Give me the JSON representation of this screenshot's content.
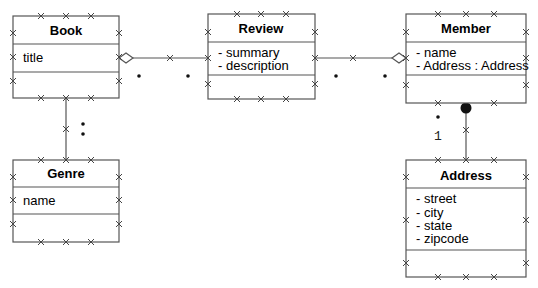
{
  "diagram": {
    "type": "UML class diagram",
    "line_color": "#555555",
    "classes": [
      {
        "name": "Book",
        "attributes": [
          "title"
        ]
      },
      {
        "name": "Review",
        "attributes": [
          "- summary",
          "- description"
        ]
      },
      {
        "name": "Member",
        "attributes": [
          "- name",
          "- Address : Address"
        ]
      },
      {
        "name": "Genre",
        "attributes": [
          "name"
        ]
      },
      {
        "name": "Address",
        "attributes": [
          "- street",
          "- city",
          "- state",
          "- zipcode"
        ]
      }
    ],
    "associations": [
      {
        "from": "Book",
        "to": "Review",
        "type": "aggregation",
        "end_marker_at": "Book",
        "multiplicity_marks": [
          "•",
          "•"
        ]
      },
      {
        "from": "Review",
        "to": "Member",
        "type": "aggregation",
        "end_marker_at": "Member",
        "multiplicity_marks": [
          "•",
          "•"
        ]
      },
      {
        "from": "Book",
        "to": "Genre",
        "type": "association",
        "multiplicity_marks": [
          "•",
          "•"
        ]
      },
      {
        "from": "Member",
        "to": "Address",
        "type": "composition",
        "end_marker_at": "Member",
        "multiplicity_label": "1",
        "multiplicity_marks": [
          "•"
        ]
      }
    ],
    "labels": {
      "member_address_multiplicity": "1"
    }
  }
}
